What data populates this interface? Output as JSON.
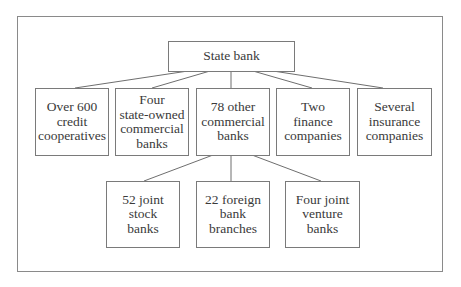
{
  "diagram": {
    "type": "organization-chart",
    "root": {
      "label": "State bank"
    },
    "level2": [
      {
        "label": "Over 600\ncredit\ncooperatives"
      },
      {
        "label": "Four\nstate-owned\ncommercial\nbanks"
      },
      {
        "label": "78 other\ncommercial\nbanks"
      },
      {
        "label": "Two\nfinance\ncompanies"
      },
      {
        "label": "Several\ninsurance\ncompanies"
      }
    ],
    "level3_parent": "78 other commercial banks",
    "level3": [
      {
        "label": "52 joint\nstock\nbanks"
      },
      {
        "label": "22 foreign\nbank\nbranches"
      },
      {
        "label": "Four joint\nventure\nbanks"
      }
    ],
    "colors": {
      "text": "#3a3a3a",
      "border": "#7a7a7a",
      "line": "#6e6e6e",
      "background": "#ffffff"
    }
  }
}
